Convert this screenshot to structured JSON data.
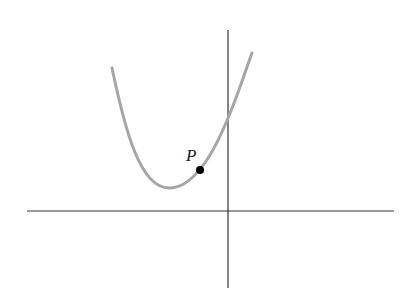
{
  "diagram": {
    "type": "function-graph",
    "axes": {
      "origin_px": [
        228,
        211
      ],
      "x_axis": {
        "from_px": [
          27,
          211
        ],
        "to_px": [
          394,
          211
        ],
        "color": "#333333"
      },
      "y_axis": {
        "from_px": [
          228,
          30
        ],
        "to_px": [
          228,
          288
        ],
        "color": "#333333"
      }
    },
    "curve": {
      "color": "#a6a6a6",
      "stroke_width": 3,
      "start_px": [
        112,
        68
      ],
      "vertex_px": [
        169,
        188
      ],
      "y_intercept_px": [
        228,
        118
      ],
      "end_px": [
        252,
        53
      ]
    },
    "point": {
      "label": "P",
      "position_px": [
        200,
        170
      ],
      "color": "#000000",
      "label_position_px": [
        186,
        161
      ]
    }
  }
}
